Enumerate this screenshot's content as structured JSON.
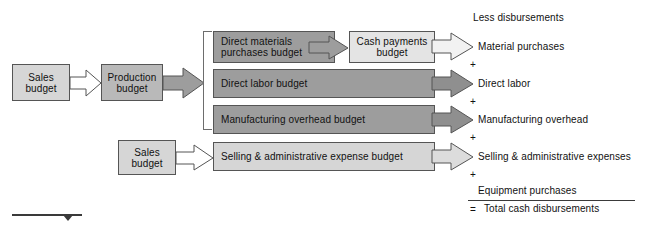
{
  "diagram": {
    "colors": {
      "box_light": "#d6d6d6",
      "box_mid": "#b9b9b9",
      "box_dark": "#9d9d9d",
      "box_pale": "#e4e4e4",
      "stroke": "#555555",
      "rule": "#3a3a3a",
      "text": "#111111"
    },
    "nodes": {
      "sales_budget_top": "Sales\nbudget",
      "sales_budget_top_line1": "Sales",
      "sales_budget_top_line2": "budget",
      "production_budget_line1": "Production",
      "production_budget_line2": "budget",
      "direct_materials_line1": "Direct materials",
      "direct_materials_line2": "purchases budget",
      "cash_payments_line1": "Cash payments",
      "cash_payments_line2": "budget",
      "direct_labor_budget": "Direct labor budget",
      "manufacturing_overhead_budget": "Manufacturing overhead budget",
      "selling_admin_budget": "Selling & administrative expense budget",
      "sales_budget_bottom_line1": "Sales",
      "sales_budget_bottom_line2": "budget"
    },
    "summary": {
      "heading": "Less disbursements",
      "items": [
        "Material purchases",
        "Direct labor",
        "Manufacturing overhead",
        "Selling & administrative expenses",
        "Equipment purchases"
      ],
      "operators": [
        "+",
        "+",
        "+",
        "+"
      ],
      "total_operator": "=",
      "total_label": "Total cash disbursements"
    }
  }
}
